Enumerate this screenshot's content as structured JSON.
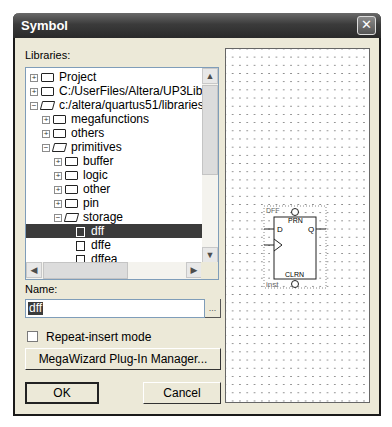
{
  "window": {
    "title": "Symbol",
    "close_icon": "close-x"
  },
  "libraries": {
    "label": "Libraries:",
    "tree": [
      {
        "label": "Project",
        "expander": "+",
        "icon": "folder-closed",
        "level": 0
      },
      {
        "label": "C:/UserFiles/Altera/UP3Libra",
        "expander": "+",
        "icon": "folder-closed",
        "level": 0
      },
      {
        "label": "c:/altera/quartus51/libraries/",
        "expander": "-",
        "icon": "folder-open",
        "level": 0
      },
      {
        "label": "megafunctions",
        "expander": "+",
        "icon": "folder-closed",
        "level": 1
      },
      {
        "label": "others",
        "expander": "+",
        "icon": "folder-closed",
        "level": 1
      },
      {
        "label": "primitives",
        "expander": "-",
        "icon": "folder-open",
        "level": 1
      },
      {
        "label": "buffer",
        "expander": "+",
        "icon": "folder-closed",
        "level": 2
      },
      {
        "label": "logic",
        "expander": "+",
        "icon": "folder-closed",
        "level": 2
      },
      {
        "label": "other",
        "expander": "+",
        "icon": "folder-closed",
        "level": 2
      },
      {
        "label": "pin",
        "expander": "+",
        "icon": "folder-closed",
        "level": 2
      },
      {
        "label": "storage",
        "expander": "-",
        "icon": "folder-open",
        "level": 2
      },
      {
        "label": "dff",
        "icon": "symbol",
        "level": 3,
        "selected": true
      },
      {
        "label": "dffe",
        "icon": "symbol",
        "level": 3
      },
      {
        "label": "dffea",
        "icon": "symbol",
        "level": 3
      }
    ]
  },
  "name": {
    "label": "Name:",
    "value": "dff",
    "browse_label": "..."
  },
  "repeat_insert": {
    "label": "Repeat-insert mode",
    "checked": false
  },
  "buttons": {
    "megawizard": "MegaWizard Plug-In Manager...",
    "ok": "OK",
    "cancel": "Cancel"
  },
  "preview": {
    "symbol_name": "DFF",
    "instance": "inst",
    "ports": {
      "d": "D",
      "q": "Q",
      "prn": "PRN",
      "clrn": "CLRN"
    }
  }
}
